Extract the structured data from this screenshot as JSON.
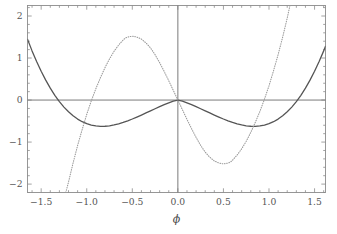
{
  "figure": {
    "background": "#ffffff",
    "frame_color": "#8c8c8c",
    "axis_line_color": "#7a7a7a"
  },
  "chart_data": {
    "type": "line",
    "title": "",
    "subtitle": "",
    "xlabel": "ϕ",
    "ylabel": "",
    "xlim": [
      -1.65,
      1.62
    ],
    "ylim": [
      -2.2,
      2.25
    ],
    "grid": false,
    "legend": null,
    "legend_position": "none",
    "xticks": [
      -1.5,
      -1.0,
      -0.5,
      0.0,
      0.5,
      1.0,
      1.5
    ],
    "xticklabels": [
      "-1.5",
      "-1.0",
      "-0.5",
      "0.0",
      "0.5",
      "1.0",
      "1.5"
    ],
    "yticks": [
      -2,
      -1,
      0,
      1,
      2
    ],
    "yticklabels": [
      "-2",
      "-1",
      "0",
      "1",
      "2"
    ],
    "minor_ticks": true,
    "zero_lines": {
      "horizontal": 0,
      "vertical": 0
    },
    "series": [
      {
        "name": "potential",
        "style": "solid",
        "color": "#555555",
        "width": 1.3,
        "description": "Double-well potential with minima at phi = -1 and phi = +1 reaching -1, local maximum 0 at phi = 0",
        "points": [
          [
            -1.65,
            1.445
          ],
          [
            -1.6,
            1.17
          ],
          [
            -1.55,
            0.916
          ],
          [
            -1.5,
            0.684
          ],
          [
            -1.45,
            0.473
          ],
          [
            -1.4,
            0.283
          ],
          [
            -1.35,
            0.113
          ],
          [
            -1.3,
            -0.037
          ],
          [
            -1.25,
            -0.168
          ],
          [
            -1.2,
            -0.28
          ],
          [
            -1.15,
            -0.375
          ],
          [
            -1.1,
            -0.453
          ],
          [
            -1.05,
            -0.515
          ],
          [
            -1.0,
            -0.562
          ],
          [
            -0.95,
            -0.596
          ],
          [
            -0.9,
            -0.616
          ],
          [
            -0.85,
            -0.625
          ],
          [
            -0.8,
            -0.624
          ],
          [
            -0.75,
            -0.613
          ],
          [
            -0.7,
            -0.593
          ],
          [
            -0.65,
            -0.566
          ],
          [
            -0.6,
            -0.533
          ],
          [
            -0.55,
            -0.494
          ],
          [
            -0.5,
            -0.451
          ],
          [
            -0.45,
            -0.405
          ],
          [
            -0.4,
            -0.357
          ],
          [
            -0.35,
            -0.307
          ],
          [
            -0.3,
            -0.257
          ],
          [
            -0.25,
            -0.207
          ],
          [
            -0.2,
            -0.157
          ],
          [
            -0.15,
            -0.11
          ],
          [
            -0.1,
            -0.065
          ],
          [
            -0.05,
            -0.026
          ],
          [
            0.0,
            0.0
          ],
          [
            0.05,
            -0.026
          ],
          [
            0.1,
            -0.065
          ],
          [
            0.15,
            -0.11
          ],
          [
            0.2,
            -0.157
          ],
          [
            0.25,
            -0.207
          ],
          [
            0.3,
            -0.257
          ],
          [
            0.35,
            -0.307
          ],
          [
            0.4,
            -0.357
          ],
          [
            0.45,
            -0.405
          ],
          [
            0.5,
            -0.451
          ],
          [
            0.55,
            -0.494
          ],
          [
            0.6,
            -0.533
          ],
          [
            0.65,
            -0.566
          ],
          [
            0.7,
            -0.593
          ],
          [
            0.75,
            -0.613
          ],
          [
            0.8,
            -0.624
          ],
          [
            0.85,
            -0.625
          ],
          [
            0.9,
            -0.616
          ],
          [
            0.95,
            -0.596
          ],
          [
            1.0,
            -0.562
          ],
          [
            1.05,
            -0.515
          ],
          [
            1.1,
            -0.453
          ],
          [
            1.15,
            -0.375
          ],
          [
            1.2,
            -0.28
          ],
          [
            1.25,
            -0.168
          ],
          [
            1.3,
            -0.037
          ],
          [
            1.35,
            0.113
          ],
          [
            1.4,
            0.283
          ],
          [
            1.45,
            0.473
          ],
          [
            1.5,
            0.684
          ],
          [
            1.55,
            0.916
          ],
          [
            1.6,
            1.17
          ],
          [
            1.62,
            1.278
          ]
        ]
      },
      {
        "name": "derivative",
        "style": "dotted",
        "color": "#9a9a9a",
        "width": 1.1,
        "description": "Odd function: crosses zero at phi = -1.5 (approx), 0 and +1.0; maximum +1.5 near phi = -0.58, minimum -1.5 near phi = +0.58; exits frame at phi = -1.22 (bottom) and phi = +1.2 (top)",
        "points": [
          [
            -1.23,
            -2.2
          ],
          [
            -1.2,
            -1.95
          ],
          [
            -1.15,
            -1.5
          ],
          [
            -1.1,
            -1.08
          ],
          [
            -1.05,
            -0.7
          ],
          [
            -1.0,
            -0.34
          ],
          [
            -0.95,
            -0.02
          ],
          [
            -0.9,
            0.27
          ],
          [
            -0.85,
            0.53
          ],
          [
            -0.8,
            0.77
          ],
          [
            -0.75,
            0.98
          ],
          [
            -0.7,
            1.16
          ],
          [
            -0.65,
            1.31
          ],
          [
            -0.6,
            1.43
          ],
          [
            -0.58,
            1.47
          ],
          [
            -0.55,
            1.5
          ],
          [
            -0.5,
            1.52
          ],
          [
            -0.45,
            1.5
          ],
          [
            -0.4,
            1.45
          ],
          [
            -0.35,
            1.36
          ],
          [
            -0.3,
            1.24
          ],
          [
            -0.25,
            1.08
          ],
          [
            -0.2,
            0.89
          ],
          [
            -0.15,
            0.68
          ],
          [
            -0.1,
            0.46
          ],
          [
            -0.05,
            0.23
          ],
          [
            0.0,
            0.0
          ],
          [
            0.05,
            -0.23
          ],
          [
            0.1,
            -0.46
          ],
          [
            0.15,
            -0.68
          ],
          [
            0.2,
            -0.89
          ],
          [
            0.25,
            -1.08
          ],
          [
            0.3,
            -1.24
          ],
          [
            0.35,
            -1.36
          ],
          [
            0.4,
            -1.45
          ],
          [
            0.45,
            -1.5
          ],
          [
            0.5,
            -1.52
          ],
          [
            0.55,
            -1.5
          ],
          [
            0.58,
            -1.47
          ],
          [
            0.6,
            -1.43
          ],
          [
            0.65,
            -1.31
          ],
          [
            0.7,
            -1.16
          ],
          [
            0.75,
            -0.98
          ],
          [
            0.8,
            -0.77
          ],
          [
            0.85,
            -0.53
          ],
          [
            0.9,
            -0.27
          ],
          [
            0.95,
            0.02
          ],
          [
            1.0,
            0.34
          ],
          [
            1.05,
            0.7
          ],
          [
            1.1,
            1.08
          ],
          [
            1.15,
            1.5
          ],
          [
            1.2,
            1.95
          ],
          [
            1.23,
            2.25
          ]
        ]
      }
    ]
  }
}
